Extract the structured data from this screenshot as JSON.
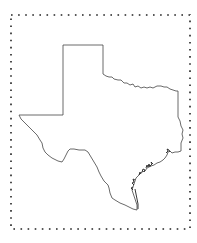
{
  "map": {
    "subject": "Texas state outline",
    "outline_color": "#333333",
    "border_dot_color": "#222222",
    "background_color": "#ffffff",
    "border": {
      "style": "dotted",
      "left": 11,
      "top": 15,
      "right": 190,
      "bottom": 229
    }
  }
}
